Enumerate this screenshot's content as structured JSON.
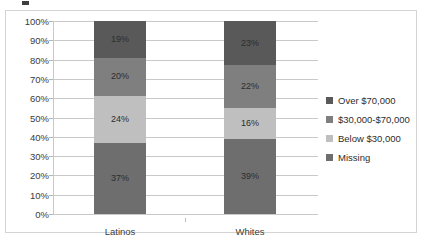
{
  "chart_data": {
    "type": "bar",
    "subtype": "stacked-100-percent",
    "title": "",
    "xlabel": "",
    "ylabel": "",
    "ylim": [
      0,
      100
    ],
    "ytick_labels": [
      "100%",
      "90%",
      "80%",
      "70%",
      "60%",
      "50%",
      "40%",
      "30%",
      "20%",
      "10%",
      "0%"
    ],
    "ytick_values": [
      100,
      90,
      80,
      70,
      60,
      50,
      40,
      30,
      20,
      10,
      0
    ],
    "grid": true,
    "legend_position": "right",
    "categories": [
      "Latinos",
      "Whites"
    ],
    "series": [
      {
        "name": "Over $70,000",
        "color": "#595959",
        "values": [
          19,
          23
        ],
        "labels": [
          "19%",
          "23%"
        ]
      },
      {
        "name": "$30,000-$70,000",
        "color": "#7f7f7f",
        "values": [
          20,
          22
        ],
        "labels": [
          "20%",
          "22%"
        ]
      },
      {
        "name": "Below $30,000",
        "color": "#bfbfbf",
        "values": [
          24,
          16
        ],
        "labels": [
          "24%",
          "16%"
        ]
      },
      {
        "name": "Missing",
        "color": "#6e6e6e",
        "values": [
          37,
          39
        ],
        "labels": [
          "37%",
          "39%"
        ]
      }
    ],
    "stack_order_bottom_to_top": [
      "Missing",
      "Below $30,000",
      "$30,000-$70,000",
      "Over $70,000"
    ]
  },
  "axis": {
    "y_ticks": [
      {
        "label": "100%",
        "value": 100
      },
      {
        "label": "90%",
        "value": 90
      },
      {
        "label": "80%",
        "value": 80
      },
      {
        "label": "70%",
        "value": 70
      },
      {
        "label": "60%",
        "value": 60
      },
      {
        "label": "50%",
        "value": 50
      },
      {
        "label": "40%",
        "value": 40
      },
      {
        "label": "30%",
        "value": 30
      },
      {
        "label": "20%",
        "value": 20
      },
      {
        "label": "10%",
        "value": 10
      },
      {
        "label": "0%",
        "value": 0
      }
    ],
    "x_categories": [
      "Latinos",
      "Whites"
    ]
  },
  "legend": {
    "items": [
      {
        "label": "Over $70,000",
        "color": "#595959"
      },
      {
        "label": "$30,000-$70,000",
        "color": "#7f7f7f"
      },
      {
        "label": "Below $30,000",
        "color": "#bfbfbf"
      },
      {
        "label": "Missing",
        "color": "#6e6e6e"
      }
    ]
  },
  "colors": {
    "frame_border": "#d4d4d4",
    "gridline": "#c9c9c9",
    "text": "#2d2d2d",
    "background": "#ffffff"
  }
}
